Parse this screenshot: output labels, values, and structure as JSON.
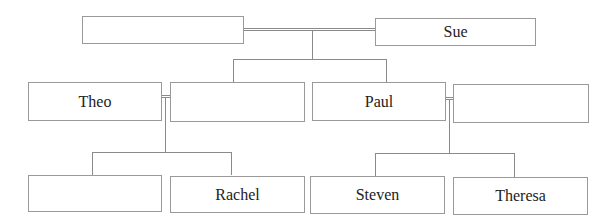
{
  "diagram": {
    "type": "family-tree",
    "generation1": [
      {
        "name": ""
      },
      {
        "name": "Sue"
      }
    ],
    "generation2": [
      {
        "name": "Theo"
      },
      {
        "name": ""
      },
      {
        "name": "Paul"
      },
      {
        "name": ""
      }
    ],
    "generation3": [
      {
        "name": ""
      },
      {
        "name": "Rachel"
      },
      {
        "name": "Steven"
      },
      {
        "name": "Theresa"
      }
    ],
    "colors": {
      "line": "#8a8a8a",
      "border": "#9a9a9a",
      "text": "#222222"
    }
  }
}
